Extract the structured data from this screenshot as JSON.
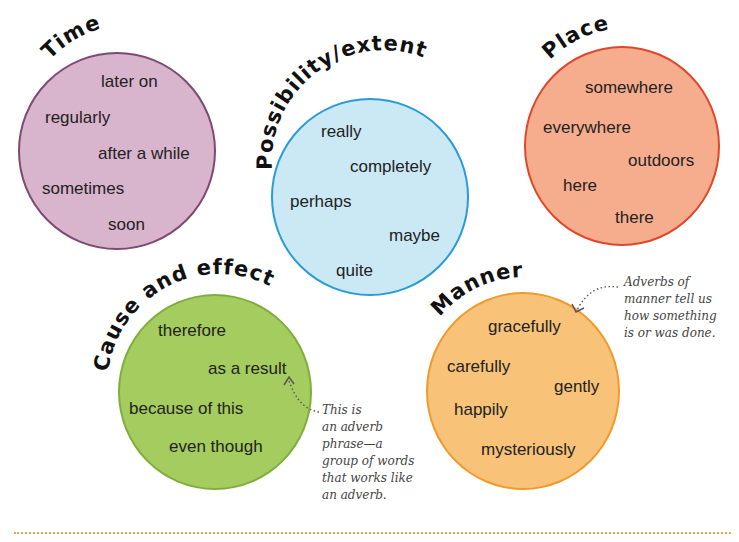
{
  "groups": {
    "time": {
      "title": "Time",
      "color_fill": "#d8b4cd",
      "color_border": "#7d4a72",
      "words": [
        "later on",
        "regularly",
        "after a while",
        "sometimes",
        "soon"
      ]
    },
    "possibility": {
      "title": "Possibility/extent",
      "color_fill": "#cbe9f5",
      "color_border": "#2a9bd6",
      "words": [
        "really",
        "completely",
        "perhaps",
        "maybe",
        "quite"
      ]
    },
    "place": {
      "title": "Place",
      "color_fill": "#f6ad8e",
      "color_border": "#e0462a",
      "words": [
        "somewhere",
        "everywhere",
        "outdoors",
        "here",
        "there"
      ]
    },
    "cause": {
      "title": "Cause and effect",
      "color_fill": "#a4cc5e",
      "color_border": "#7fae3c",
      "words": [
        "therefore",
        "as a result",
        "because of this",
        "even though"
      ]
    },
    "manner": {
      "title": "Manner",
      "color_fill": "#f8c278",
      "color_border": "#ef9a2a",
      "words": [
        "gracefully",
        "carefully",
        "gently",
        "happily",
        "mysteriously"
      ]
    }
  },
  "notes": {
    "manner_note": "Adverbs of\nmanner tell us\nhow something\nis or was done.",
    "phrase_note": "This is\nan adverb\nphrase—a\ngroup of words\nthat works like\nan adverb."
  },
  "divider_color": "#f2a34a"
}
